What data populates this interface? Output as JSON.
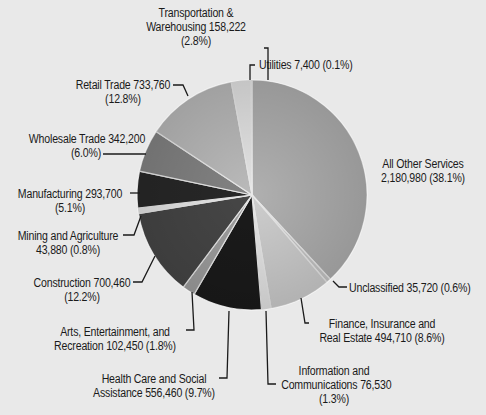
{
  "chart_data": {
    "type": "pie",
    "title": "",
    "legend": "none (callout labels)",
    "categories": [
      "All Other Services",
      "Unclassified",
      "Finance, Insurance and Real Estate",
      "Information and Communications",
      "Health Care and Social Assistance",
      "Arts, Entertainment, and Recreation",
      "Construction",
      "Mining and Agriculture",
      "Manufacturing",
      "Wholesale Trade",
      "Retail Trade",
      "Transportation & Warehousing",
      "Utilities"
    ],
    "values": [
      2180980,
      35720,
      494710,
      76530,
      556460,
      102450,
      700460,
      43880,
      293700,
      342200,
      733760,
      158222,
      7400
    ],
    "percentages": [
      38.1,
      0.6,
      8.6,
      1.3,
      9.7,
      1.8,
      12.2,
      0.8,
      5.1,
      6.0,
      12.8,
      2.8,
      0.1
    ],
    "slice_colors": [
      "#b9b9b9",
      "#d2d2d2",
      "#d9d9d9",
      "#f2f2f2",
      "#1c1c1c",
      "#a8a8a8",
      "#4a4a4a",
      "#f4f4f4",
      "#2a2a2a",
      "#8a8a8a",
      "#c4c4c4",
      "#f0f0f0",
      "#ffffff"
    ]
  },
  "labels": {
    "transport": [
      "Transportation &",
      "Warehousing 158,222",
      "(2.8%)"
    ],
    "utilities": [
      "Utilities 7,400 (0.1%)"
    ],
    "retail": [
      "Retail Trade 733,760",
      "(12.8%)"
    ],
    "wholesale": [
      "Wholesale Trade 342,200",
      "(6.0%)"
    ],
    "manufacturing": [
      "Manufacturing 293,700",
      "(5.1%)"
    ],
    "mining": [
      "Mining and Agriculture",
      "43,880 (0.8%)"
    ],
    "construction": [
      "Construction 700,460",
      "(12.2%)"
    ],
    "arts": [
      "Arts, Entertainment, and",
      "Recreation 102,450 (1.8%)"
    ],
    "health": [
      "Health Care and Social",
      "Assistance 556,460 (9.7%)"
    ],
    "other": [
      "All Other Services",
      "2,180,980 (38.1%)"
    ],
    "unclassified": [
      "Unclassified 35,720 (0.6%)"
    ],
    "finance": [
      "Finance, Insurance and",
      "Real Estate 494,710 (8.6%)"
    ],
    "info": [
      "Information and",
      "Communications 76,530",
      "(1.3%)"
    ]
  },
  "colors": {
    "background": "#e9e9e9",
    "leader": "#1a1a1a",
    "text": "#1a1a1a"
  }
}
